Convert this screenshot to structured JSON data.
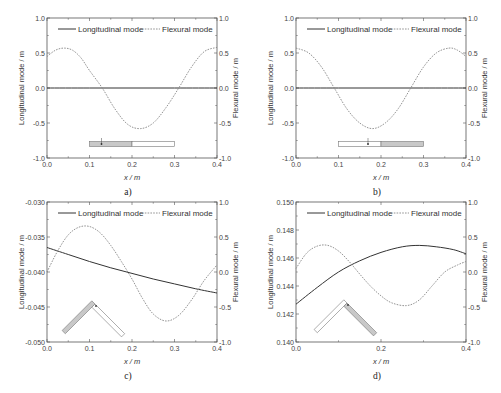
{
  "chart_data": [
    {
      "type": "line",
      "panel": "a",
      "caption": "a)",
      "xlabel": "x / m",
      "ylabel_left": "Longitudinal mode / m",
      "ylabel_right": "Flexural mode / m",
      "xlim": [
        0.0,
        0.4
      ],
      "ylim_left": [
        -1.0,
        1.0
      ],
      "ylim_right": [
        -1.0,
        1.0
      ],
      "xticks": [
        "0.0",
        "0.1",
        "0.2",
        "0.3",
        "0.4"
      ],
      "yticks_left": [
        "-1.0",
        "-0.5",
        "0.0",
        "0.5",
        "1.0"
      ],
      "yticks_right": [
        "-1.0",
        "-0.5",
        "0.0",
        "0.5",
        "1.0"
      ],
      "legend": [
        "Longitudinal mode",
        "Flexural mode"
      ],
      "legend_position": "top",
      "grid": false,
      "inset": "straight-beam-left-shaded",
      "series": [
        {
          "name": "Longitudinal mode",
          "axis": "left",
          "style": "solid",
          "x": [
            0.0,
            0.1,
            0.2,
            0.3,
            0.4
          ],
          "y": [
            0.0,
            0.0,
            0.0,
            0.0,
            0.0
          ]
        },
        {
          "name": "Flexural mode",
          "axis": "right",
          "style": "dashed",
          "x": [
            0.0,
            0.02,
            0.04,
            0.06,
            0.08,
            0.1,
            0.13,
            0.16,
            0.19,
            0.22,
            0.25,
            0.28,
            0.31,
            0.34,
            0.37,
            0.4
          ],
          "y": [
            0.45,
            0.54,
            0.57,
            0.54,
            0.43,
            0.25,
            0.0,
            -0.3,
            -0.52,
            -0.58,
            -0.5,
            -0.28,
            0.0,
            0.3,
            0.52,
            0.58
          ]
        }
      ]
    },
    {
      "type": "line",
      "panel": "b",
      "caption": "b)",
      "xlabel": "x / m",
      "ylabel_left": "Longitudinal mode / m",
      "ylabel_right": "Flexural mode / m",
      "xlim": [
        0.0,
        0.4
      ],
      "ylim_left": [
        -1.0,
        1.0
      ],
      "ylim_right": [
        -1.0,
        1.0
      ],
      "xticks": [
        "0.0",
        "0.1",
        "0.2",
        "0.3",
        "0.4"
      ],
      "yticks_left": [
        "-1.0",
        "-0.5",
        "0.0",
        "0.5",
        "1.0"
      ],
      "yticks_right": [
        "-1.0",
        "-0.5",
        "0.0",
        "0.5",
        "1.0"
      ],
      "legend": [
        "Longitudinal mode",
        "Flexural mode"
      ],
      "legend_position": "top",
      "grid": false,
      "inset": "straight-beam-right-shaded",
      "series": [
        {
          "name": "Longitudinal mode",
          "axis": "left",
          "style": "solid",
          "x": [
            0.0,
            0.1,
            0.2,
            0.3,
            0.4
          ],
          "y": [
            0.0,
            0.0,
            0.0,
            0.0,
            0.0
          ]
        },
        {
          "name": "Flexural mode",
          "axis": "right",
          "style": "dashed",
          "x": [
            0.0,
            0.03,
            0.06,
            0.09,
            0.12,
            0.15,
            0.18,
            0.21,
            0.24,
            0.27,
            0.3,
            0.33,
            0.36,
            0.38,
            0.4
          ],
          "y": [
            0.57,
            0.5,
            0.3,
            0.0,
            -0.3,
            -0.5,
            -0.58,
            -0.5,
            -0.3,
            0.0,
            0.3,
            0.5,
            0.57,
            0.54,
            0.45
          ]
        }
      ]
    },
    {
      "type": "line",
      "panel": "c",
      "caption": "c)",
      "xlabel": "x / m",
      "ylabel_left": "Longitudinal mode / m",
      "ylabel_right": "Flexural mode / m",
      "xlim": [
        0.0,
        0.4
      ],
      "ylim_left": [
        -0.05,
        -0.03
      ],
      "ylim_right": [
        -1.0,
        1.0
      ],
      "xticks": [
        "0.0",
        "0.1",
        "0.2",
        "0.3",
        "0.4"
      ],
      "yticks_left": [
        "-0.050",
        "-0.045",
        "-0.040",
        "-0.035",
        "-0.030"
      ],
      "yticks_right": [
        "-1.0",
        "-0.5",
        "0.0",
        "0.5",
        "1.0"
      ],
      "legend": [
        "Longitudinal mode",
        "Flexural mode"
      ],
      "legend_position": "top",
      "grid": false,
      "inset": "bent-beam-left-shaded",
      "series": [
        {
          "name": "Longitudinal mode",
          "axis": "left",
          "style": "solid",
          "x": [
            0.0,
            0.05,
            0.1,
            0.15,
            0.2,
            0.25,
            0.3,
            0.35,
            0.4
          ],
          "y": [
            -0.0365,
            -0.0375,
            -0.0385,
            -0.0394,
            -0.0402,
            -0.041,
            -0.0417,
            -0.0424,
            -0.043
          ]
        },
        {
          "name": "Flexural mode",
          "axis": "right",
          "style": "dashed",
          "x": [
            0.0,
            0.025,
            0.05,
            0.075,
            0.1,
            0.125,
            0.15,
            0.175,
            0.2,
            0.225,
            0.25,
            0.28,
            0.31,
            0.34,
            0.37,
            0.4
          ],
          "y": [
            0.0,
            0.3,
            0.53,
            0.64,
            0.65,
            0.56,
            0.38,
            0.15,
            -0.1,
            -0.38,
            -0.6,
            -0.7,
            -0.62,
            -0.4,
            -0.12,
            0.1
          ]
        }
      ]
    },
    {
      "type": "line",
      "panel": "d",
      "caption": "d)",
      "xlabel": "x / m",
      "ylabel_left": "Longitudinal mode / m",
      "ylabel_right": "Flexural mode / m",
      "xlim": [
        0.0,
        0.4
      ],
      "ylim_left": [
        0.14,
        0.15
      ],
      "ylim_right": [
        -1.0,
        1.0
      ],
      "xticks": [
        "0.0",
        "0.2",
        "0.4"
      ],
      "yticks_left": [
        "0.140",
        "0.142",
        "0.144",
        "0.146",
        "0.148",
        "0.150"
      ],
      "yticks_right": [
        "-1.0",
        "-0.5",
        "0.0",
        "0.5",
        "1.0"
      ],
      "legend": [
        "Longitudinal mode",
        "Flexural mode"
      ],
      "legend_position": "top",
      "grid": false,
      "inset": "bent-beam-right-shaded",
      "series": [
        {
          "name": "Longitudinal mode",
          "axis": "left",
          "style": "solid",
          "x": [
            0.0,
            0.05,
            0.1,
            0.15,
            0.2,
            0.25,
            0.29,
            0.33,
            0.37,
            0.4
          ],
          "y": [
            0.1427,
            0.1439,
            0.145,
            0.1458,
            0.1464,
            0.1468,
            0.1469,
            0.1468,
            0.1466,
            0.1463
          ]
        },
        {
          "name": "Flexural mode",
          "axis": "right",
          "style": "dashed",
          "x": [
            0.0,
            0.025,
            0.05,
            0.075,
            0.1,
            0.125,
            0.15,
            0.175,
            0.2,
            0.225,
            0.26,
            0.29,
            0.32,
            0.35,
            0.38,
            0.4
          ],
          "y": [
            0.05,
            0.27,
            0.37,
            0.38,
            0.3,
            0.15,
            -0.03,
            -0.2,
            -0.34,
            -0.44,
            -0.48,
            -0.4,
            -0.2,
            0.0,
            0.1,
            0.15
          ]
        }
      ]
    }
  ]
}
